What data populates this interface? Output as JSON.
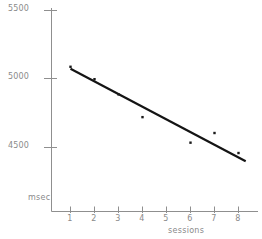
{
  "chart_data": {
    "type": "scatter",
    "title": "",
    "subtitle": "",
    "xlabel": "sessions",
    "ylabel": "msec",
    "grid": false,
    "legend": false,
    "legend_position": "none",
    "xlim": [
      0.5,
      8.7
    ],
    "ylim": [
      4280,
      5500
    ],
    "xticks": [
      1,
      2,
      3,
      4,
      5,
      6,
      7,
      8
    ],
    "xtick_labels": [
      "1",
      "2",
      "3",
      "4",
      "5",
      "6",
      "7",
      "8"
    ],
    "yticks": [
      4500,
      5000,
      5500
    ],
    "ytick_labels": [
      "4500",
      "5000",
      "5500"
    ],
    "x": [
      1,
      2,
      3,
      4,
      6,
      7,
      8
    ],
    "values": [
      5085,
      4995,
      4885,
      4720,
      4535,
      4605,
      4460
    ],
    "series": [
      {
        "name": "mean reaction time",
        "kind": "scatter",
        "x": [
          1,
          2,
          3,
          4,
          6,
          7,
          8
        ],
        "values": [
          5085,
          4995,
          4885,
          4720,
          4535,
          4605,
          4460
        ]
      },
      {
        "name": "linear fit",
        "kind": "line",
        "x": [
          1,
          8.3
        ],
        "values": [
          5070,
          4400
        ]
      }
    ],
    "marker_color": "#1a1a1a",
    "line_color": "#141414",
    "axis_color": "#8f8f8f",
    "background": "#ffffff"
  },
  "axes": {
    "y_title": "msec",
    "x_title": "sessions"
  }
}
